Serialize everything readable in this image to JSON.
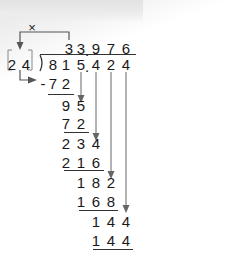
{
  "diagram": {
    "type": "long-division",
    "multiply_symbol": "×",
    "divisor": [
      "2",
      "4"
    ],
    "dividend": [
      "8",
      "1",
      "5",
      ".",
      "4",
      "2",
      "4"
    ],
    "quotient": [
      "3",
      "3",
      ".",
      "9",
      "7",
      "6"
    ],
    "steps": [
      {
        "subtract": [
          "-",
          "7",
          "2"
        ]
      },
      {
        "remainder": [
          "9",
          "5"
        ]
      },
      {
        "subtract": [
          "7",
          "2"
        ]
      },
      {
        "remainder": [
          "2",
          "3",
          "4"
        ]
      },
      {
        "subtract": [
          "2",
          "1",
          "6"
        ]
      },
      {
        "remainder": [
          "1",
          "8",
          "2"
        ]
      },
      {
        "subtract": [
          "1",
          "6",
          "8"
        ]
      },
      {
        "remainder": [
          "1",
          "4",
          "4"
        ]
      },
      {
        "subtract": [
          "1",
          "4",
          "4"
        ]
      }
    ],
    "colors": {
      "text": "#1a1a1a",
      "arrow": "#555555",
      "bracket": "#777777"
    }
  }
}
